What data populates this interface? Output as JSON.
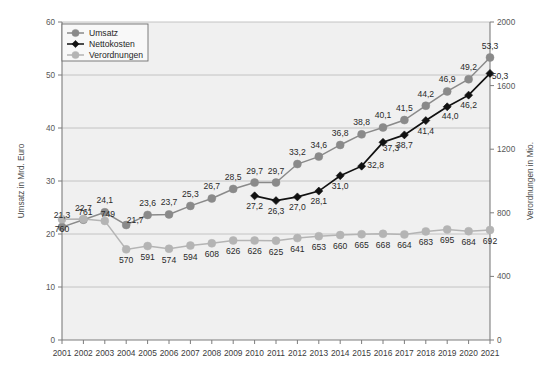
{
  "chart_data": {
    "type": "line",
    "title": "",
    "xlabel": "",
    "ylabel": "Umsatz in Mrd. Euro",
    "y2label": "Verordnungen in Mio.",
    "ylim": [
      0,
      60
    ],
    "y2lim": [
      0,
      2000
    ],
    "yticks": [
      "0",
      "10",
      "20",
      "30",
      "40",
      "50",
      "60"
    ],
    "y2ticks": [
      "0",
      "400",
      "800",
      "1200",
      "1600",
      "2000"
    ],
    "grid": true,
    "legend_position": "top-left",
    "categories": [
      "2001",
      "2002",
      "2003",
      "2004",
      "2005",
      "2006",
      "2007",
      "2008",
      "2009",
      "2010",
      "2011",
      "2012",
      "2013",
      "2014",
      "2015",
      "2016",
      "2017",
      "2018",
      "2019",
      "2020",
      "2021"
    ],
    "series": [
      {
        "name": "Umsatz",
        "axis": "left",
        "color": "#8a8a8a",
        "marker": "circle",
        "values": [
          21.3,
          22.7,
          24.1,
          21.7,
          23.6,
          23.7,
          25.3,
          26.7,
          28.5,
          29.7,
          29.7,
          33.2,
          34.6,
          36.8,
          38.8,
          40.1,
          41.5,
          44.2,
          46.9,
          49.2,
          53.3
        ],
        "labels": [
          "21,3",
          "22,7",
          "24,1",
          "21,7",
          "23,6",
          "23,7",
          "25,3",
          "26,7",
          "28,5",
          "29,7",
          "29,7",
          "33,2",
          "34,6",
          "36,8",
          "38,8",
          "40,1",
          "41,5",
          "44,2",
          "46,9",
          "49,2",
          "53,3"
        ]
      },
      {
        "name": "Nettokosten",
        "axis": "left",
        "color": "#111111",
        "marker": "diamond",
        "values": [
          null,
          null,
          null,
          null,
          null,
          null,
          null,
          null,
          null,
          27.2,
          26.3,
          27.0,
          28.1,
          31.0,
          32.8,
          37.3,
          38.7,
          41.4,
          44.0,
          46.2,
          50.3
        ],
        "labels": [
          "",
          "",
          "",
          "",
          "",
          "",
          "",
          "",
          "",
          "27,2",
          "26,3",
          "27,0",
          "28,1",
          "31,0",
          "32,8",
          "37,3",
          "38,7",
          "41,4",
          "44,0",
          "46,2",
          "50,3"
        ]
      },
      {
        "name": "Verordnungen",
        "axis": "right",
        "color": "#b4b4b4",
        "marker": "circle",
        "values": [
          760,
          761,
          749,
          570,
          591,
          574,
          594,
          608,
          626,
          626,
          625,
          641,
          653,
          660,
          665,
          668,
          664,
          683,
          695,
          684,
          692
        ],
        "labels": [
          "760",
          "761",
          "749",
          "570",
          "591",
          "574",
          "594",
          "608",
          "626",
          "626",
          "625",
          "641",
          "653",
          "660",
          "665",
          "668",
          "664",
          "683",
          "695",
          "684",
          "692"
        ]
      }
    ]
  },
  "legend": {
    "items": [
      {
        "label": "Umsatz"
      },
      {
        "label": "Nettokosten"
      },
      {
        "label": "Verordnungen"
      }
    ]
  },
  "colors": {
    "plot_background": "#f0f0f0",
    "grid": "#bdbdbd",
    "axis": "#7d7d7d",
    "umsatz": "#8a8a8a",
    "nettokosten": "#111111",
    "verordnungen": "#b4b4b4"
  }
}
